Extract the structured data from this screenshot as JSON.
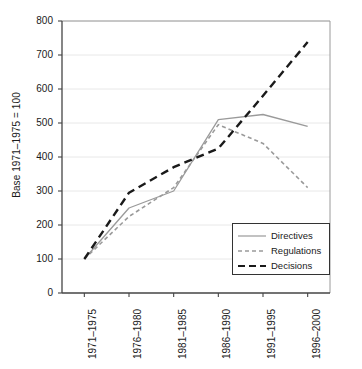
{
  "chart_data": {
    "type": "line",
    "title": "",
    "xlabel": "",
    "ylabel": "Base 1971–1975 = 100",
    "categories": [
      "1971–1975",
      "1976–1980",
      "1981–1985",
      "1986–1990",
      "1991–1995",
      "1996–2000"
    ],
    "ylim": [
      0,
      800
    ],
    "ytick_values": [
      0,
      100,
      200,
      300,
      400,
      500,
      600,
      700,
      800
    ],
    "ytick_labels": [
      "0",
      "100",
      "200",
      "300",
      "400",
      "500",
      "600",
      "700",
      "800"
    ],
    "grid": true,
    "legend_position": "lower-right",
    "series": [
      {
        "name": "Directives",
        "values": [
          100,
          250,
          300,
          510,
          525,
          490
        ],
        "color": "#9a9a9a",
        "style": "solid"
      },
      {
        "name": "Regulations",
        "values": [
          100,
          225,
          310,
          495,
          440,
          310
        ],
        "color": "#9a9a9a",
        "style": "dashed"
      },
      {
        "name": "Decisions",
        "values": [
          100,
          295,
          370,
          425,
          580,
          738
        ],
        "color": "#1a1a1a",
        "style": "dashed"
      }
    ]
  },
  "legend": {
    "items": [
      {
        "label": "Directives"
      },
      {
        "label": "Regulations"
      },
      {
        "label": "Decisions"
      }
    ]
  },
  "axis": {
    "y_label": "Base 1971–1975 = 100",
    "y_ticks": [
      "800",
      "700",
      "600",
      "500",
      "400",
      "300",
      "200",
      "100",
      "0"
    ],
    "x_ticks": [
      "1971–1975",
      "1976–1980",
      "1981–1985",
      "1986–1990",
      "1991–1995",
      "1996–2000"
    ]
  },
  "colors": {
    "axis": "#444444",
    "grid": "#e8e8e8",
    "gray_series": "#9a9a9a",
    "black_series": "#1a1a1a",
    "background": "#ffffff"
  }
}
